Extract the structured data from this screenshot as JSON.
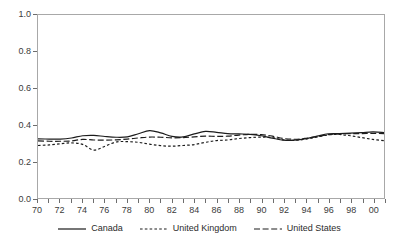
{
  "chart_data": {
    "type": "line",
    "title": "",
    "subtitle": "",
    "xlabel": "",
    "ylabel": "",
    "xlim": [
      1970,
      2001
    ],
    "ylim": [
      0.0,
      1.0
    ],
    "grid": false,
    "legend_position": "bottom",
    "y_ticks": [
      "0.0",
      "0.2",
      "0.4",
      "0.6",
      "0.8",
      "1.0"
    ],
    "y_tick_values": [
      0.0,
      0.2,
      0.4,
      0.6,
      0.8,
      1.0
    ],
    "x_tick_labels": [
      "70",
      "72",
      "74",
      "76",
      "78",
      "80",
      "82",
      "84",
      "86",
      "88",
      "90",
      "92",
      "94",
      "96",
      "98",
      "00"
    ],
    "x_tick_values": [
      1970,
      1972,
      1974,
      1976,
      1978,
      1980,
      1982,
      1984,
      1986,
      1988,
      1990,
      1992,
      1994,
      1996,
      1998,
      2000
    ],
    "x_minor_ticks": [
      1971,
      1973,
      1975,
      1977,
      1979,
      1981,
      1983,
      1985,
      1987,
      1989,
      1991,
      1993,
      1995,
      1997,
      1999,
      2001
    ],
    "x": [
      1970,
      1971,
      1972,
      1973,
      1974,
      1975,
      1976,
      1977,
      1978,
      1979,
      1980,
      1981,
      1982,
      1983,
      1984,
      1985,
      1986,
      1987,
      1988,
      1989,
      1990,
      1991,
      1992,
      1993,
      1994,
      1995,
      1996,
      1997,
      1998,
      1999,
      2000,
      2001
    ],
    "series": [
      {
        "name": "Canada",
        "style": "solid",
        "color": "#1c1c1c",
        "values": [
          0.323,
          0.322,
          0.322,
          0.328,
          0.34,
          0.342,
          0.336,
          0.332,
          0.334,
          0.351,
          0.368,
          0.356,
          0.337,
          0.334,
          0.35,
          0.364,
          0.359,
          0.352,
          0.35,
          0.348,
          0.34,
          0.327,
          0.316,
          0.316,
          0.324,
          0.338,
          0.351,
          0.352,
          0.354,
          0.357,
          0.361,
          0.358
        ]
      },
      {
        "name": "United Kingdom",
        "style": "dotted",
        "color": "#1c1c1c",
        "values": [
          0.287,
          0.29,
          0.296,
          0.301,
          0.293,
          0.262,
          0.283,
          0.306,
          0.308,
          0.304,
          0.294,
          0.286,
          0.283,
          0.287,
          0.292,
          0.304,
          0.314,
          0.317,
          0.325,
          0.33,
          0.333,
          0.33,
          0.318,
          0.315,
          0.322,
          0.333,
          0.345,
          0.347,
          0.34,
          0.33,
          0.32,
          0.313
        ]
      },
      {
        "name": "United States",
        "style": "dashed",
        "color": "#1c1c1c",
        "values": [
          0.312,
          0.31,
          0.31,
          0.312,
          0.32,
          0.317,
          0.316,
          0.318,
          0.322,
          0.328,
          0.333,
          0.332,
          0.329,
          0.33,
          0.334,
          0.338,
          0.337,
          0.338,
          0.344,
          0.348,
          0.346,
          0.338,
          0.325,
          0.321,
          0.326,
          0.335,
          0.346,
          0.35,
          0.352,
          0.352,
          0.353,
          0.352
        ]
      }
    ]
  },
  "legend": {
    "entries": [
      {
        "label": "Canada"
      },
      {
        "label": "United Kingdom"
      },
      {
        "label": "United States"
      }
    ]
  }
}
